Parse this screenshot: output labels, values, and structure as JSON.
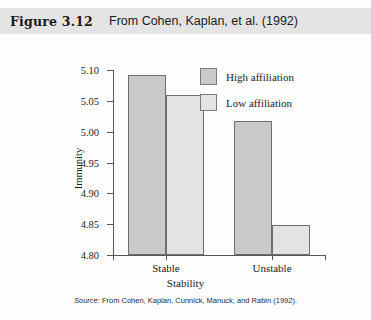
{
  "header": {
    "figure_number": "Figure 3.12",
    "caption": "From Cohen, Kaplan, et al. (1992)"
  },
  "source_note": {
    "prefix": "Source:",
    "text": "From Cohen, Kaplan, Cunnick, Manuck, and Rabin (1992)."
  },
  "colors": {
    "high_affiliation": "#c9c9c9",
    "low_affiliation": "#e3e3e3",
    "bar_border": "#6d6f70",
    "axis": "#55595b",
    "header_band": "#e4e4e4"
  },
  "chart_data": {
    "type": "bar",
    "title": "",
    "xlabel": "Stability",
    "ylabel": "Immunity",
    "categories": [
      "Stable",
      "Unstable"
    ],
    "series": [
      {
        "name": "High affiliation",
        "values": [
          5.092,
          5.018
        ],
        "color": "#c9c9c9"
      },
      {
        "name": "Low affiliation",
        "values": [
          5.059,
          4.848
        ],
        "color": "#e3e3e3"
      }
    ],
    "ylim": [
      4.8,
      5.1
    ],
    "yticks": [
      4.8,
      4.85,
      4.9,
      4.95,
      5.0,
      5.05,
      5.1
    ],
    "ytick_labels": [
      "4.80",
      "4.85",
      "4.90",
      "4.95",
      "5.00",
      "5.05",
      "5.10"
    ],
    "grid": false,
    "legend_position": "top-right",
    "legend_entries": [
      "High affiliation",
      "Low affiliation"
    ]
  }
}
